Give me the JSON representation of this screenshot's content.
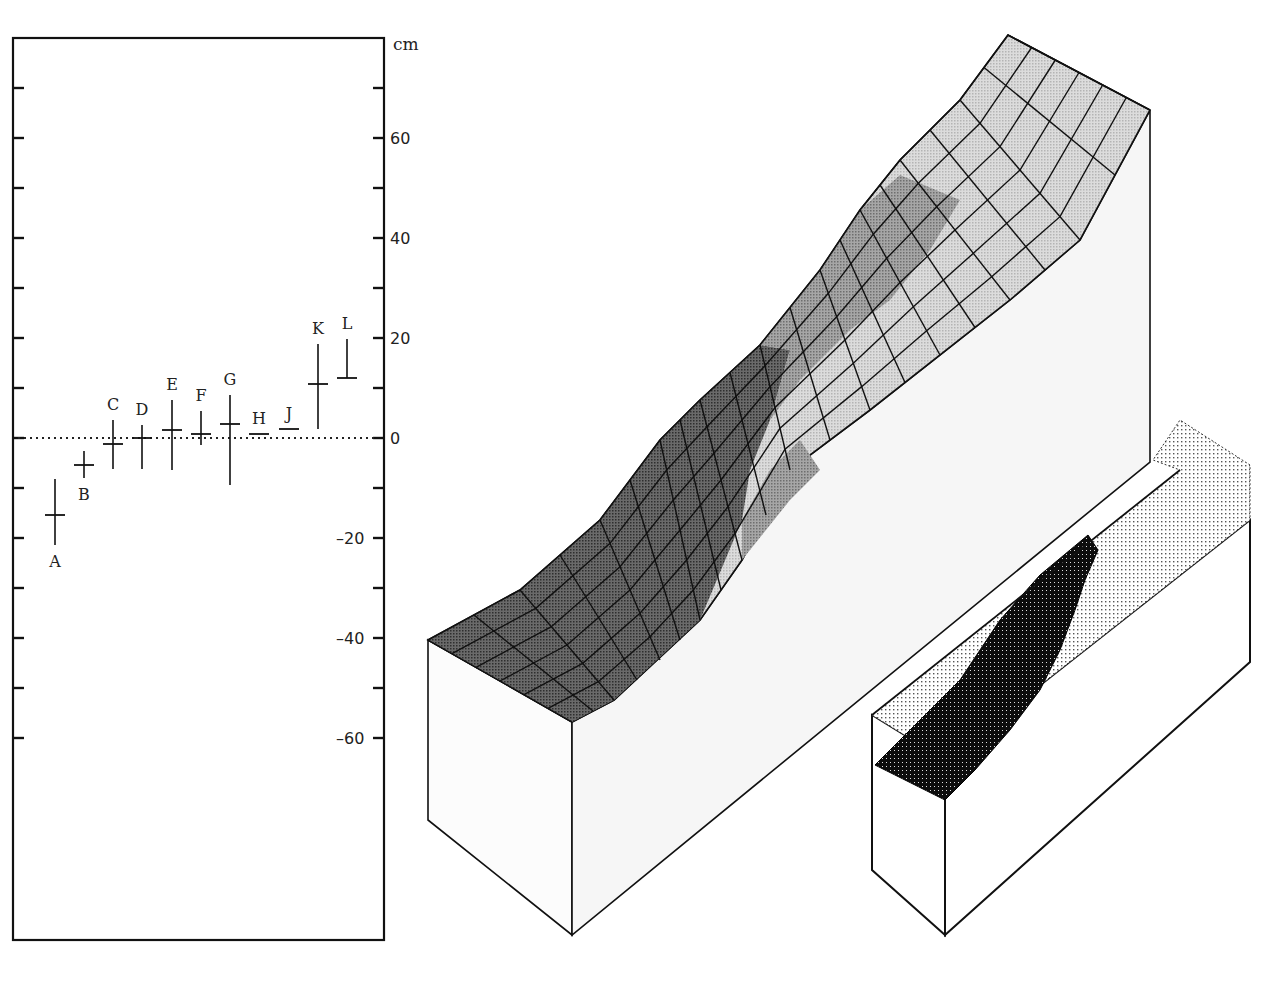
{
  "figure": {
    "left_panel": {
      "name": "displacement error-bar chart",
      "unit": "cm",
      "zero_line": "dotted"
    },
    "right_panel": {
      "name": "3D block diagrams of slope surface",
      "large_block": "shaded wireframe slope surface with hatched grid",
      "small_block": "dot-matrix rendering of slope with dark slumped region"
    }
  },
  "chart_data": {
    "type": "scatter",
    "title": "",
    "xlabel": "",
    "ylabel": "cm",
    "ylim": [
      -100,
      80
    ],
    "y_ticks": [
      60,
      40,
      20,
      0,
      -20,
      -40,
      -60
    ],
    "y_tick_labels": [
      "60",
      "40",
      "20",
      "0",
      "-20",
      "-40",
      "-60"
    ],
    "minor_tick_step": 10,
    "grid": false,
    "reference_line": {
      "y": 0,
      "style": "dotted"
    },
    "points": [
      {
        "label": "A",
        "value": -15.4,
        "upper": -8.2,
        "lower": -21.4,
        "label_pos": "below"
      },
      {
        "label": "B",
        "value": -5.4,
        "upper": -2.6,
        "lower": -8.0,
        "label_pos": "below"
      },
      {
        "label": "C",
        "value": -1.2,
        "upper": 3.6,
        "lower": -6.2,
        "label_pos": "above"
      },
      {
        "label": "D",
        "value": 0.0,
        "upper": 2.6,
        "lower": -6.2,
        "label_pos": "above"
      },
      {
        "label": "E",
        "value": 1.6,
        "upper": 7.6,
        "lower": -6.4,
        "label_pos": "above"
      },
      {
        "label": "F",
        "value": 0.8,
        "upper": 5.4,
        "lower": -1.4,
        "label_pos": "above"
      },
      {
        "label": "G",
        "value": 2.8,
        "upper": 8.6,
        "lower": -9.4,
        "label_pos": "above"
      },
      {
        "label": "H",
        "value": 0.8,
        "upper": 0.8,
        "lower": 0.8,
        "label_pos": "above"
      },
      {
        "label": "J",
        "value": 1.8,
        "upper": 1.8,
        "lower": 1.8,
        "label_pos": "above"
      },
      {
        "label": "K",
        "value": 10.8,
        "upper": 18.8,
        "lower": 1.8,
        "label_pos": "above"
      },
      {
        "label": "L",
        "value": 12.0,
        "upper": 19.8,
        "lower": 12.0,
        "label_pos": "above"
      }
    ]
  },
  "colors": {
    "ink": "#111111",
    "dark_surface": "#4a4a4a",
    "mid_surface": "#8a8a8a",
    "light_surface": "#c8c8c8",
    "lightest_surface": "#dedede",
    "face": "#fbfbfb"
  }
}
